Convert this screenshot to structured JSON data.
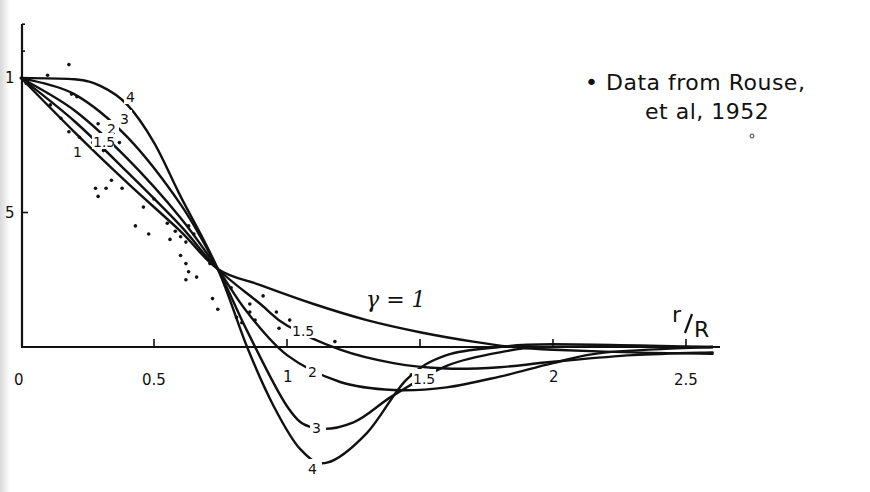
{
  "chart_data": {
    "type": "line",
    "title": "",
    "xlabel": "r/R",
    "ylabel": "",
    "xlim": [
      0,
      2.65
    ],
    "ylim": [
      -0.45,
      1.2
    ],
    "grid": false,
    "x_ticks": [
      {
        "value": 0,
        "label": "0"
      },
      {
        "value": 0.5,
        "label": "0.5"
      },
      {
        "value": 1,
        "label": "1"
      },
      {
        "value": 1.5,
        "label": "1.5"
      },
      {
        "value": 2,
        "label": "2"
      },
      {
        "value": 2.5,
        "label": "2.5"
      }
    ],
    "y_ticks": [
      {
        "value": 1,
        "label": "1"
      },
      {
        "value": 0.5,
        "label": "5"
      },
      {
        "value": 0,
        "label": ""
      }
    ],
    "series": [
      {
        "name": "γ = 1",
        "label": "γ = 1",
        "x": [
          0,
          0.2,
          0.4,
          0.6,
          0.74,
          0.9,
          1.1,
          1.3,
          1.5,
          1.7,
          1.85,
          2.0,
          2.3,
          2.6
        ],
        "y": [
          1.0,
          0.8,
          0.61,
          0.43,
          0.29,
          0.23,
          0.16,
          0.1,
          0.055,
          0.02,
          0.0,
          -0.01,
          -0.02,
          -0.025
        ]
      },
      {
        "name": "γ = 1.5",
        "label": "1.5",
        "x": [
          0,
          0.2,
          0.4,
          0.6,
          0.74,
          0.9,
          1.0,
          1.2,
          1.4,
          1.6,
          1.8,
          2.0,
          2.3,
          2.6
        ],
        "y": [
          1.0,
          0.84,
          0.65,
          0.45,
          0.29,
          0.16,
          0.08,
          -0.01,
          -0.06,
          -0.08,
          -0.075,
          -0.055,
          -0.03,
          -0.02
        ]
      },
      {
        "name": "γ = 2",
        "label": "2",
        "x": [
          0,
          0.2,
          0.4,
          0.6,
          0.74,
          0.85,
          1.0,
          1.2,
          1.4,
          1.6,
          1.8,
          2.0,
          2.2,
          2.6
        ],
        "y": [
          1.0,
          0.88,
          0.7,
          0.48,
          0.29,
          0.13,
          -0.03,
          -0.13,
          -0.16,
          -0.15,
          -0.11,
          -0.06,
          -0.02,
          0.0
        ]
      },
      {
        "name": "γ = 3",
        "label": "3",
        "x": [
          0,
          0.2,
          0.4,
          0.6,
          0.74,
          0.85,
          1.0,
          1.1,
          1.25,
          1.4,
          1.6,
          1.8,
          2.0,
          2.6
        ],
        "y": [
          1.0,
          0.94,
          0.78,
          0.53,
          0.29,
          0.06,
          -0.22,
          -0.3,
          -0.28,
          -0.18,
          -0.07,
          -0.02,
          0.0,
          0.0
        ]
      },
      {
        "name": "γ = 4",
        "label": "4",
        "x": [
          0,
          0.2,
          0.3,
          0.4,
          0.5,
          0.6,
          0.74,
          0.85,
          0.95,
          1.05,
          1.15,
          1.3,
          1.45,
          1.6,
          1.8,
          2.0,
          2.6
        ],
        "y": [
          1.0,
          0.995,
          0.97,
          0.9,
          0.76,
          0.56,
          0.29,
          0.0,
          -0.22,
          -0.38,
          -0.43,
          -0.32,
          -0.12,
          -0.03,
          0.0,
          0.01,
          0.0
        ]
      }
    ],
    "scatter": {
      "name": "Data from Rouse, et al, 1952",
      "points": [
        [
          0.1,
          1.01
        ],
        [
          0.18,
          1.05
        ],
        [
          0.02,
          0.98
        ],
        [
          0.02,
          0.99
        ],
        [
          0.19,
          0.94
        ],
        [
          0.21,
          0.93
        ],
        [
          0.11,
          0.9
        ],
        [
          0.15,
          0.85
        ],
        [
          0.29,
          0.83
        ],
        [
          0.18,
          0.8
        ],
        [
          0.22,
          0.78
        ],
        [
          0.22,
          0.74
        ],
        [
          0.27,
          0.76
        ],
        [
          0.31,
          0.73
        ],
        [
          0.37,
          0.76
        ],
        [
          0.34,
          0.62
        ],
        [
          0.29,
          0.56
        ],
        [
          0.28,
          0.59
        ],
        [
          0.32,
          0.59
        ],
        [
          0.38,
          0.59
        ],
        [
          0.46,
          0.52
        ],
        [
          0.43,
          0.45
        ],
        [
          0.5,
          0.55
        ],
        [
          0.48,
          0.42
        ],
        [
          0.55,
          0.46
        ],
        [
          0.58,
          0.43
        ],
        [
          0.56,
          0.4
        ],
        [
          0.6,
          0.41
        ],
        [
          0.63,
          0.45
        ],
        [
          0.62,
          0.39
        ],
        [
          0.65,
          0.42
        ],
        [
          0.6,
          0.34
        ],
        [
          0.62,
          0.31
        ],
        [
          0.63,
          0.28
        ],
        [
          0.62,
          0.25
        ],
        [
          0.66,
          0.26
        ],
        [
          0.71,
          0.31
        ],
        [
          0.79,
          0.22
        ],
        [
          0.72,
          0.18
        ],
        [
          0.74,
          0.14
        ],
        [
          0.81,
          0.11
        ],
        [
          0.86,
          0.16
        ],
        [
          0.91,
          0.19
        ],
        [
          0.83,
          0.09
        ],
        [
          0.88,
          0.1
        ],
        [
          0.86,
          0.13
        ],
        [
          0.96,
          0.13
        ],
        [
          0.97,
          0.07
        ],
        [
          1.01,
          0.1
        ],
        [
          1.18,
          0.02
        ]
      ]
    },
    "annotations": [
      {
        "text": "γ = 1",
        "x": 1.3,
        "y": 0.17
      },
      {
        "text": "• Data from Rouse,",
        "line": 1
      },
      {
        "text": "et al, 1952",
        "line": 2
      }
    ]
  },
  "legend": {
    "line1": "• Data from Rouse,",
    "line2": "et al, 1952"
  },
  "labels": {
    "gamma": "γ = 1",
    "xaxis_r": "r",
    "xaxis_R": "R",
    "curve_labels_upper": [
      "4",
      "3",
      "2",
      "1.5",
      "1"
    ],
    "curve_labels_lower": [
      "1.5",
      "2",
      "3",
      "4",
      "1.5",
      "2"
    ]
  }
}
